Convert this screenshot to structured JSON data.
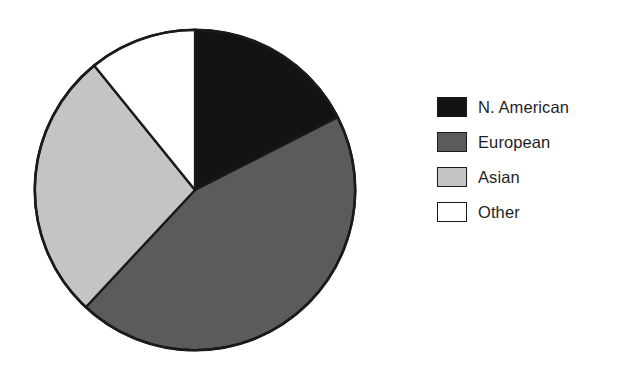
{
  "chart_data": {
    "type": "pie",
    "title": "",
    "subtitle": "",
    "xlabel": "",
    "ylabel": "",
    "grid": false,
    "legend_position": "right",
    "start_angle_deg": 0,
    "direction": "clockwise",
    "categories": [
      "N. American",
      "European",
      "Asian",
      "Other"
    ],
    "values": [
      17.5,
      44.5,
      27.2,
      10.8
    ],
    "units": "percent",
    "slices": [
      {
        "label": "N. American",
        "value": 17.5,
        "color": "#131313",
        "start_angle_deg": 0,
        "end_angle_deg": 63,
        "sweep_deg": 63
      },
      {
        "label": "European",
        "value": 44.5,
        "color": "#5b5b5b",
        "start_angle_deg": 63,
        "end_angle_deg": 223,
        "sweep_deg": 160
      },
      {
        "label": "Asian",
        "value": 27.2,
        "color": "#c4c4c4",
        "start_angle_deg": 223,
        "end_angle_deg": 321,
        "sweep_deg": 98
      },
      {
        "label": "Other",
        "value": 10.8,
        "color": "#ffffff",
        "start_angle_deg": 321,
        "end_angle_deg": 360,
        "sweep_deg": 39
      }
    ],
    "annotations": []
  },
  "legend": {
    "items": [
      {
        "label": "N. American",
        "color": "#131313",
        "swatch_name": "legend-swatch-n-american"
      },
      {
        "label": "European",
        "color": "#5b5b5b",
        "swatch_name": "legend-swatch-european"
      },
      {
        "label": "Asian",
        "color": "#c4c4c4",
        "swatch_name": "legend-swatch-asian"
      },
      {
        "label": "Other",
        "color": "#ffffff",
        "swatch_name": "legend-swatch-other"
      }
    ]
  },
  "style": {
    "outline_color": "#1a1a1a",
    "background": "#ffffff"
  }
}
